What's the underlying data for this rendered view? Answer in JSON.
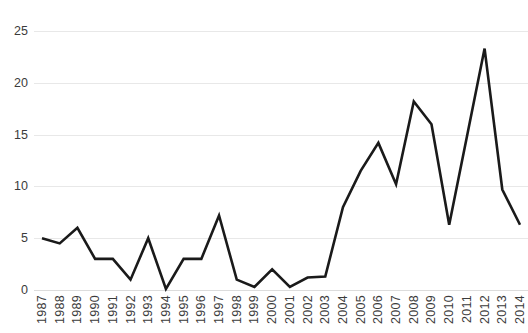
{
  "chart_data": {
    "type": "line",
    "title": "",
    "subtitle": "",
    "xlabel": "",
    "ylabel": "",
    "grid": true,
    "legend": null,
    "legend_position": "none",
    "line_color": "#1a1a1a",
    "gridline_color": "#e8e8e8",
    "background_color": "#ffffff",
    "xlim": [
      1987,
      2014
    ],
    "ylim": [
      0,
      25
    ],
    "ytick_labels": [
      "0",
      "5",
      "10",
      "15",
      "20",
      "25"
    ],
    "yticks": [
      0,
      5,
      10,
      15,
      20,
      25
    ],
    "categories": [
      "1987",
      "1988",
      "1989",
      "1990",
      "1991",
      "1992",
      "1993",
      "1994",
      "1995",
      "1996",
      "1997",
      "1998",
      "1999",
      "2000",
      "2001",
      "2002",
      "2003",
      "2004",
      "2005",
      "2006",
      "2007",
      "2008",
      "2009",
      "2010",
      "2011",
      "2012",
      "2013",
      "2014"
    ],
    "values": [
      5.0,
      4.5,
      6.0,
      3.0,
      3.0,
      1.0,
      5.0,
      0.1,
      3.0,
      3.0,
      7.2,
      1.0,
      0.3,
      2.0,
      0.3,
      1.2,
      1.3,
      8.0,
      11.5,
      14.2,
      10.2,
      18.2,
      16.0,
      6.3,
      14.8,
      23.3,
      9.7,
      6.3
    ],
    "series": [
      {
        "name": "series-1",
        "values": [
          5.0,
          4.5,
          6.0,
          3.0,
          3.0,
          1.0,
          5.0,
          0.1,
          3.0,
          3.0,
          7.2,
          1.0,
          0.3,
          2.0,
          0.3,
          1.2,
          1.3,
          8.0,
          11.5,
          14.2,
          10.2,
          18.2,
          16.0,
          6.3,
          14.8,
          23.3,
          9.7,
          6.3
        ]
      }
    ],
    "annotations": []
  }
}
